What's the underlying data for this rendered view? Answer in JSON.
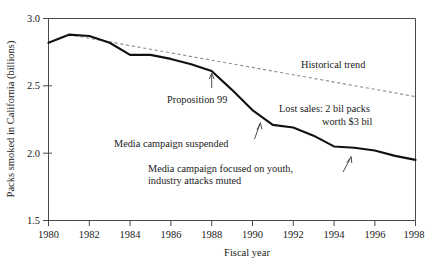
{
  "chart_data": {
    "type": "line",
    "title": "",
    "xlabel": "Fiscal year",
    "ylabel": "Packs smoked in California (billions)",
    "xlim": [
      1980,
      1998
    ],
    "ylim": [
      1.5,
      3.0
    ],
    "xticks": [
      1980,
      1982,
      1984,
      1986,
      1988,
      1990,
      1992,
      1994,
      1996,
      1998
    ],
    "xticklabels": [
      "1980",
      "1982",
      "1984",
      "1986",
      "1988",
      "1990",
      "1992",
      "1994",
      "1996",
      "1998"
    ],
    "yticks": [
      1.5,
      2.0,
      2.5,
      3.0
    ],
    "yticklabels": [
      "1.5",
      "2.0",
      "2.5",
      "3.0"
    ],
    "grid": false,
    "legend_position": "none",
    "x": [
      1980,
      1981,
      1982,
      1983,
      1984,
      1985,
      1986,
      1987,
      1988,
      1989,
      1990,
      1991,
      1992,
      1993,
      1994,
      1995,
      1996,
      1997,
      1998
    ],
    "series": [
      {
        "name": "Packs smoked in California",
        "style": "solid",
        "color": "#111111",
        "values": [
          2.82,
          2.88,
          2.87,
          2.82,
          2.73,
          2.73,
          2.7,
          2.66,
          2.61,
          2.47,
          2.32,
          2.21,
          2.19,
          2.13,
          2.05,
          2.04,
          2.02,
          1.98,
          1.95
        ]
      },
      {
        "name": "Historical trend",
        "style": "dashed",
        "color": "#8d8d8d",
        "x": [
          1981,
          1998
        ],
        "values": [
          2.88,
          2.42
        ]
      }
    ],
    "annotations": [
      {
        "name": "historical-trend",
        "text": "Historical trend",
        "x": 1992.0,
        "y": 2.62,
        "arrow": false
      },
      {
        "name": "proposition-99",
        "text": "Proposition 99",
        "x": 1987.2,
        "y": 2.29,
        "arrow": true,
        "points_to": {
          "x": 1988.0,
          "y": 2.59
        }
      },
      {
        "name": "lost-sales",
        "text_line_1": "Lost sales: 2 bil packs",
        "text_line_2": "worth $3 bil",
        "x": 1993.8,
        "y": 2.3,
        "arrow": false
      },
      {
        "name": "media-campaign-suspended",
        "text": "Media campaign suspended",
        "x": 1986.9,
        "y": 2.07,
        "arrow": true,
        "points_to": {
          "x": 1991.0,
          "y": 2.21
        }
      },
      {
        "name": "media-campaign-youth",
        "text_line_1": "Media campaign focused on youth,",
        "text_line_2": "industry attacks muted",
        "x": 1988.2,
        "y": 1.91,
        "arrow": true,
        "points_to": {
          "x": 1995.1,
          "y": 2.04
        }
      }
    ]
  },
  "labels": {
    "y_axis_title": "Packs smoked in California (billions)",
    "x_axis_title": "Fiscal year",
    "ytick_3_0": "3.0",
    "ytick_2_5": "2.5",
    "ytick_2_0": "2.0",
    "ytick_1_5": "1.5",
    "xtick_1980": "1980",
    "xtick_1982": "1982",
    "xtick_1984": "1984",
    "xtick_1986": "1986",
    "xtick_1988": "1988",
    "xtick_1990": "1990",
    "xtick_1992": "1992",
    "xtick_1994": "1994",
    "xtick_1996": "1996",
    "xtick_1998": "1998",
    "annot_historical_trend": "Historical trend",
    "annot_proposition_99": "Proposition 99",
    "annot_lost_sales_1": "Lost sales: 2 bil packs",
    "annot_lost_sales_2": "worth $3 bil",
    "annot_media_suspended": "Media campaign suspended",
    "annot_media_youth_1": "Media campaign focused on youth,",
    "annot_media_youth_2": "industry attacks muted"
  },
  "colors": {
    "data_line": "#111111",
    "trend_line": "#8d8d8d",
    "axis": "#4a4a4a",
    "text": "#1a1a1a",
    "background": "#ffffff"
  }
}
